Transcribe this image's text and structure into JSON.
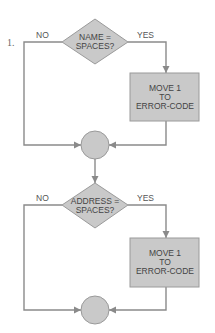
{
  "figure": {
    "step_number": "1.",
    "blocks": [
      {
        "decision": {
          "lines": [
            "NAME =",
            "SPACES?"
          ]
        },
        "no_label": "NO",
        "yes_label": "YES",
        "process": {
          "lines": [
            "MOVE 1",
            "TO",
            "ERROR-CODE"
          ]
        },
        "connector": "junction"
      },
      {
        "decision": {
          "lines": [
            "ADDRESS =",
            "SPACES?"
          ]
        },
        "no_label": "NO",
        "yes_label": "YES",
        "process": {
          "lines": [
            "MOVE 1",
            "TO",
            "ERROR-CODE"
          ]
        },
        "connector": "junction"
      }
    ]
  }
}
